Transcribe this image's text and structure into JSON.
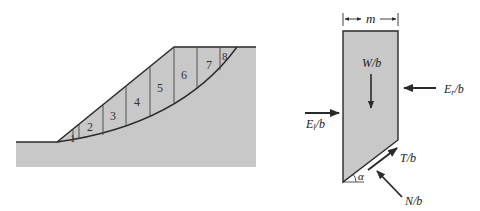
{
  "colors": {
    "fill": "#c8c8c8",
    "stroke": "#2a2a2a",
    "background": "#ffffff"
  },
  "slope_diagram": {
    "slices": [
      {
        "label": "1",
        "x": 73,
        "y": 139
      },
      {
        "label": "2",
        "x": 91,
        "y": 130
      },
      {
        "label": "3",
        "x": 113,
        "y": 120
      },
      {
        "label": "4",
        "x": 138,
        "y": 106
      },
      {
        "label": "5",
        "x": 160,
        "y": 92
      },
      {
        "label": "6",
        "x": 184,
        "y": 79
      },
      {
        "label": "7",
        "x": 209,
        "y": 69
      },
      {
        "label": "8",
        "x": 226,
        "y": 59
      }
    ]
  },
  "slice_diagram": {
    "width_label": "m",
    "weight_label": "W/b",
    "right_force_label": "E",
    "right_force_sub": "r",
    "right_force_suffix": "/b",
    "left_force_label": "E",
    "left_force_sub": "l",
    "left_force_suffix": "/b",
    "shear_label": "T/b",
    "normal_label": "N/b",
    "angle_label": "α"
  }
}
